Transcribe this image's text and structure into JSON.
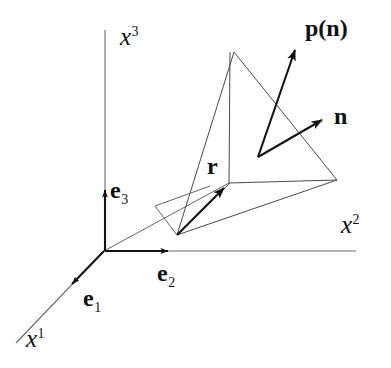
{
  "figure": {
    "background_color": "#ffffff",
    "ink_color": "#111111",
    "axis_color": "#6b6b6b",
    "edge_color": "#4a4a4a"
  },
  "axes": [
    {
      "id": "x1",
      "base": "x",
      "superscript": "1",
      "label": "x1"
    },
    {
      "id": "x2",
      "base": "x",
      "superscript": "2",
      "label": "x2"
    },
    {
      "id": "x3",
      "base": "x",
      "superscript": "3",
      "label": "x3"
    }
  ],
  "basis_vectors": [
    {
      "id": "e1",
      "base": "e",
      "subscript": "1"
    },
    {
      "id": "e2",
      "base": "e",
      "subscript": "2"
    },
    {
      "id": "e3",
      "base": "e",
      "subscript": "3"
    }
  ],
  "vectors": [
    {
      "id": "r",
      "label": "r",
      "description": "position vector to surface point"
    },
    {
      "id": "n",
      "label": "n",
      "description": "unit outward normal of the oblique face"
    },
    {
      "id": "pn",
      "label": "p(n)",
      "description": "traction vector on the face with normal n"
    }
  ],
  "labels": {
    "x1": "x",
    "x1_sup": "1",
    "x2": "x",
    "x2_sup": "2",
    "x3": "x",
    "x3_sup": "3",
    "e1": "e",
    "e1_sub": "1",
    "e2": "e",
    "e2_sub": "2",
    "e3": "e",
    "e3_sub": "3",
    "r": "r",
    "n": "n",
    "pn": "p(n)"
  },
  "geometry": {
    "origin": [
      104,
      251
    ],
    "tetra_apex": [
      234,
      52
    ],
    "tetra_front_left": [
      177,
      235
    ],
    "tetra_right": [
      337,
      180
    ],
    "tetra_inner": [
      229,
      183
    ],
    "vector_foot": [
      258,
      157
    ],
    "n_tip": [
      330,
      118
    ],
    "pn_tip": [
      299,
      42
    ]
  }
}
